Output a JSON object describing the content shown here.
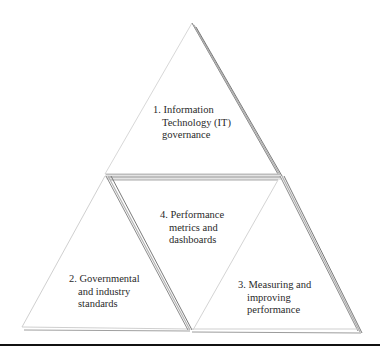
{
  "diagram": {
    "type": "triangle-of-triangles",
    "triangles": [
      {
        "id": 1,
        "position": "top",
        "lines": [
          "1. Information",
          "Technology (IT)",
          "governance"
        ]
      },
      {
        "id": 2,
        "position": "bottom-left",
        "lines": [
          "2. Governmental",
          "and industry",
          "standards"
        ]
      },
      {
        "id": 3,
        "position": "bottom-right",
        "lines": [
          "3. Measuring and",
          "improving",
          "performance"
        ]
      },
      {
        "id": 4,
        "position": "center-inverted",
        "lines": [
          "4. Performance",
          "metrics and",
          "dashboards"
        ]
      }
    ],
    "colors": {
      "edge_dark": "#6e6e6e",
      "edge_light": "#d4d4d4",
      "fill": "#ffffff",
      "rule": "#111111"
    }
  }
}
